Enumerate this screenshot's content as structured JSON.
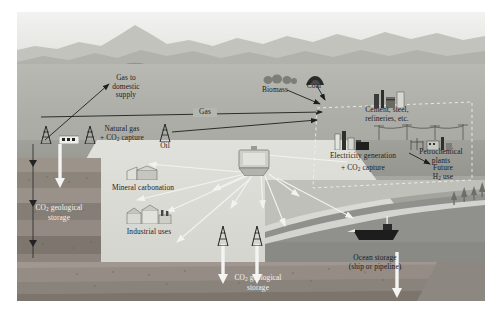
{
  "figure": {
    "labels": {
      "gas_to_domestic_supply": "Gas to\ndomestic\nsupply",
      "gas_to_domestic_supply_l1": "Gas to",
      "gas_to_domestic_supply_l2": "domestic",
      "gas_to_domestic_supply_l3": "supply",
      "gas": "Gas",
      "natural_gas_l1": "Natural gas",
      "natural_gas_l2": "+ CO2 capture",
      "oil": "Oil",
      "biomass": "Biomass",
      "coal": "Coal",
      "cement_l1": "Cement, steel,",
      "cement_l2": "refineries, etc.",
      "electricity_generation": "Electricity generation",
      "electricity_capture": "+ CO2 capture",
      "petrochemical_l1": "Petrochemical",
      "petrochemical_l2": "plants",
      "future_h2_l1": "Future",
      "future_h2_l2": "H2 use",
      "mineral_carbonation": "Mineral carbonation",
      "industrial_uses": "Industrial uses",
      "co2_geological_storage_left_l1": "CO2 geological",
      "co2_geological_storage_left_l2": "storage",
      "co2_geological_storage_bottom_l1": "CO2 geological",
      "co2_geological_storage_bottom_l2": "storage",
      "ocean_storage_l1": "Ocean storage",
      "ocean_storage_l2": "(ship or pipeline)"
    },
    "icons": {
      "oil_derrick": "oil-derrick-icon",
      "gas_rig": "gas-rig-icon",
      "coal_pile": "coal-pile-icon",
      "biomass_trees": "biomass-trees-icon",
      "cement_plant": "cement-plant-icon",
      "power_plant": "power-plant-icon",
      "petrochemical_plant": "petrochemical-plant-icon",
      "mineral_plant": "mineral-carbonation-plant-icon",
      "industrial_buildings": "industrial-buildings-icon",
      "storage_tank": "co2-storage-tank-icon",
      "ship": "ship-icon",
      "pipeline_arrow": "pipeline-arrow-icon"
    },
    "colors": {
      "sky": "#f1f1ef",
      "mountain_far": "#b8b8b2",
      "mountain_near": "#a8a8a2",
      "land": "#b2b2ac",
      "plain": "#d8d8d3",
      "sea": "#8e8e8a",
      "sea_deep": "#7d7d79",
      "strata_1": "#9c948b",
      "strata_2": "#8b837b",
      "strata_3": "#7b746d",
      "strata_4": "#6d6760",
      "arrow_dark": "#1e1e1e",
      "arrow_light": "#f2f2f0",
      "label_dark": "#1c1c1c",
      "label_light": "#f4f4f2",
      "frame": "#ffffff"
    }
  }
}
